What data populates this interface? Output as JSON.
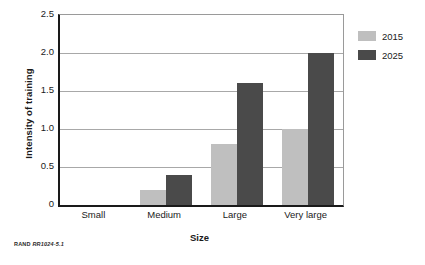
{
  "chart_data": {
    "type": "bar",
    "title": "",
    "subtitle": "",
    "xlabel": "Size",
    "ylabel": "Intensity of training",
    "categories": [
      "Small",
      "Medium",
      "Large",
      "Very large"
    ],
    "series": [
      {
        "name": "2015",
        "values": [
          0,
          0.2,
          0.8,
          1.0
        ],
        "color": "#bfbfbf"
      },
      {
        "name": "2025",
        "values": [
          0,
          0.4,
          1.6,
          2.0
        ],
        "color": "#4a4a4a"
      }
    ],
    "ylim": [
      0,
      2.5
    ],
    "yticks": [
      0,
      0.5,
      1.0,
      1.5,
      2.0,
      2.5
    ],
    "ytick_labels": [
      "0",
      "0.5",
      "1.0",
      "1.5",
      "2.0",
      "2.5"
    ],
    "grid": "horizontal",
    "legend_position": "right-top",
    "orientation": "vertical",
    "grouping": "grouped"
  },
  "legend": {
    "items": [
      {
        "label": "2015",
        "color": "#bfbfbf"
      },
      {
        "label": "2025",
        "color": "#4a4a4a"
      }
    ]
  },
  "credit": {
    "org": "RAND",
    "id": "RR1024-5.1"
  },
  "colors": {
    "series_2015": "#bfbfbf",
    "series_2025": "#4a4a4a",
    "axis": "#1a1a1a",
    "gridline": "#a8a8a8",
    "background": "#ffffff"
  }
}
